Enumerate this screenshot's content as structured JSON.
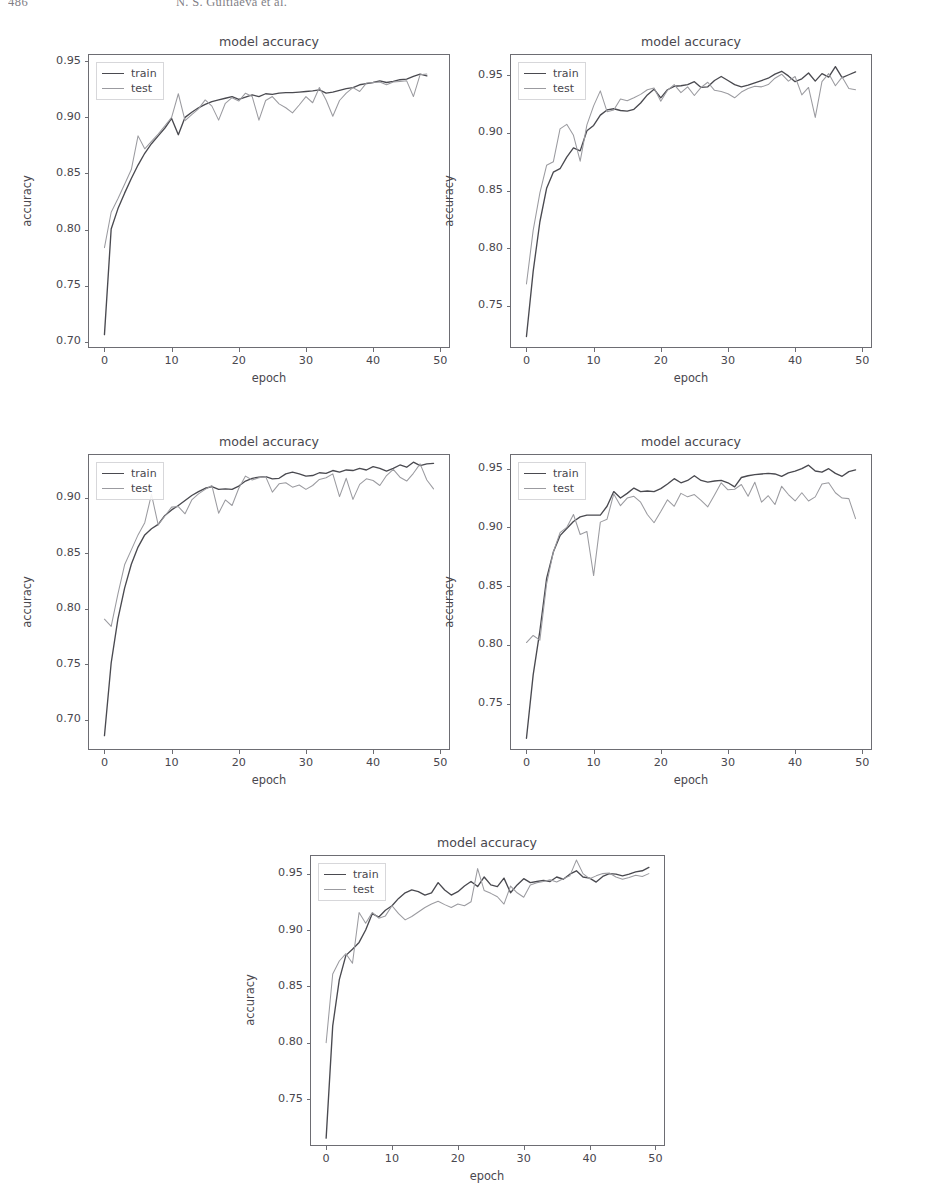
{
  "page": {
    "folio": "486",
    "running_title": "N. S. Gultiaeva et al."
  },
  "style": {
    "train_color": "#4a4a50",
    "test_color": "#9b9ba0",
    "axis_color": "#6d6d73",
    "text_color": "#49474e",
    "background": "#ffffff"
  },
  "legend": {
    "train_label": "train",
    "test_label": "test",
    "position": "upper left"
  },
  "chart_data": [
    {
      "id": "model-accuracy-1",
      "type": "line",
      "title": "model accuracy",
      "xlabel": "epoch",
      "ylabel": "accuracy",
      "xlim": [
        -2.45,
        51.45
      ],
      "ylim": [
        0.6946,
        0.9564
      ],
      "xticks": [
        0,
        10,
        20,
        30,
        40,
        50
      ],
      "xticklabels": [
        "0",
        "10",
        "20",
        "30",
        "40",
        "50"
      ],
      "yticks": [
        0.7,
        0.75,
        0.8,
        0.85,
        0.9,
        0.95
      ],
      "yticklabels": [
        "0.70",
        "0.75",
        "0.80",
        "0.85",
        "0.90",
        "0.95"
      ],
      "grid": false,
      "box": {
        "left": 88,
        "top": 54,
        "width": 362,
        "height": 294
      },
      "title_pos": {
        "x": 269,
        "y": 42
      },
      "xlabel_pos": {
        "x": 269,
        "y": 378
      },
      "ylabel_pos": {
        "x": 27,
        "y": 201
      },
      "legend_pos": {
        "x": 96,
        "y": 62
      },
      "x": [
        0,
        1,
        2,
        3,
        4,
        5,
        6,
        7,
        8,
        9,
        10,
        11,
        12,
        13,
        14,
        15,
        16,
        17,
        18,
        19,
        20,
        21,
        22,
        23,
        24,
        25,
        26,
        27,
        28,
        29,
        30,
        31,
        32,
        33,
        34,
        35,
        36,
        37,
        38,
        39,
        40,
        41,
        42,
        43,
        44,
        45,
        46,
        47,
        48
      ],
      "series": [
        {
          "name": "train",
          "values": [
            0.7065,
            0.8005,
            0.8185,
            0.8325,
            0.8455,
            0.8575,
            0.868,
            0.8765,
            0.8835,
            0.8905,
            0.899,
            0.8845,
            0.9,
            0.9045,
            0.9085,
            0.9115,
            0.914,
            0.9155,
            0.917,
            0.9185,
            0.916,
            0.918,
            0.92,
            0.9185,
            0.921,
            0.9205,
            0.9215,
            0.922,
            0.922,
            0.9225,
            0.923,
            0.9235,
            0.9245,
            0.9215,
            0.9225,
            0.924,
            0.9255,
            0.9265,
            0.929,
            0.93,
            0.931,
            0.9325,
            0.931,
            0.932,
            0.9335,
            0.934,
            0.9365,
            0.9385,
            0.937
          ]
        },
        {
          "name": "test",
          "values": [
            0.784,
            0.8155,
            0.8275,
            0.8405,
            0.8535,
            0.8835,
            0.872,
            0.8785,
            0.885,
            0.8925,
            0.9,
            0.921,
            0.897,
            0.9025,
            0.9075,
            0.9155,
            0.91,
            0.8975,
            0.9125,
            0.9175,
            0.9145,
            0.9215,
            0.9185,
            0.8975,
            0.915,
            0.9185,
            0.912,
            0.9085,
            0.904,
            0.911,
            0.9185,
            0.913,
            0.9265,
            0.9155,
            0.901,
            0.915,
            0.9215,
            0.9265,
            0.923,
            0.9305,
            0.931,
            0.9315,
            0.929,
            0.9315,
            0.932,
            0.9325,
            0.9185,
            0.938,
            0.9385
          ]
        }
      ]
    },
    {
      "id": "model-accuracy-2",
      "type": "line",
      "title": "model accuracy",
      "xlabel": "epoch",
      "ylabel": "accuracy",
      "xlim": [
        -2.45,
        51.45
      ],
      "ylim": [
        0.7135,
        0.9685
      ],
      "xticks": [
        0,
        10,
        20,
        30,
        40,
        50
      ],
      "xticklabels": [
        "0",
        "10",
        "20",
        "30",
        "40",
        "50"
      ],
      "yticks": [
        0.75,
        0.8,
        0.85,
        0.9,
        0.95
      ],
      "yticklabels": [
        "0.75",
        "0.80",
        "0.85",
        "0.90",
        "0.95"
      ],
      "grid": false,
      "box": {
        "left": 510,
        "top": 54,
        "width": 362,
        "height": 294
      },
      "title_pos": {
        "x": 691,
        "y": 42
      },
      "xlabel_pos": {
        "x": 691,
        "y": 378
      },
      "ylabel_pos": {
        "x": 449,
        "y": 201
      },
      "legend_pos": {
        "x": 518,
        "y": 62
      },
      "x": [
        0,
        1,
        2,
        3,
        4,
        5,
        6,
        7,
        8,
        9,
        10,
        11,
        12,
        13,
        14,
        15,
        16,
        17,
        18,
        19,
        20,
        21,
        22,
        23,
        24,
        25,
        26,
        27,
        28,
        29,
        30,
        31,
        32,
        33,
        34,
        35,
        36,
        37,
        38,
        39,
        40,
        41,
        42,
        43,
        44,
        45,
        46,
        47,
        48,
        49
      ],
      "series": [
        {
          "name": "train",
          "values": [
            0.7235,
            0.78,
            0.823,
            0.852,
            0.866,
            0.869,
            0.879,
            0.887,
            0.8845,
            0.902,
            0.9065,
            0.9155,
            0.92,
            0.921,
            0.9195,
            0.919,
            0.9205,
            0.926,
            0.933,
            0.938,
            0.9305,
            0.9375,
            0.9405,
            0.941,
            0.942,
            0.9445,
            0.9395,
            0.94,
            0.9455,
            0.949,
            0.9455,
            0.942,
            0.94,
            0.9415,
            0.9435,
            0.9455,
            0.9475,
            0.951,
            0.9535,
            0.9495,
            0.9445,
            0.947,
            0.952,
            0.945,
            0.9515,
            0.9485,
            0.9575,
            0.948,
            0.9505,
            0.953
          ]
        },
        {
          "name": "test",
          "values": [
            0.769,
            0.8155,
            0.848,
            0.872,
            0.875,
            0.9035,
            0.9075,
            0.898,
            0.8755,
            0.907,
            0.9235,
            0.9365,
            0.9185,
            0.92,
            0.9295,
            0.928,
            0.9305,
            0.9335,
            0.9375,
            0.939,
            0.9275,
            0.937,
            0.942,
            0.935,
            0.94,
            0.9325,
            0.9395,
            0.944,
            0.937,
            0.936,
            0.934,
            0.9305,
            0.9355,
            0.9385,
            0.9405,
            0.94,
            0.942,
            0.9475,
            0.951,
            0.945,
            0.949,
            0.933,
            0.9395,
            0.9135,
            0.9445,
            0.9515,
            0.941,
            0.9485,
            0.9385,
            0.9375
          ]
        }
      ]
    },
    {
      "id": "model-accuracy-3",
      "type": "line",
      "title": "model accuracy",
      "xlabel": "epoch",
      "ylabel": "accuracy",
      "xlim": [
        -2.45,
        51.45
      ],
      "ylim": [
        0.6726,
        0.9394
      ],
      "xticks": [
        0,
        10,
        20,
        30,
        40,
        50
      ],
      "xticklabels": [
        "0",
        "10",
        "20",
        "30",
        "40",
        "50"
      ],
      "yticks": [
        0.7,
        0.75,
        0.8,
        0.85,
        0.9
      ],
      "yticklabels": [
        "0.70",
        "0.75",
        "0.80",
        "0.85",
        "0.90"
      ],
      "grid": false,
      "box": {
        "left": 88,
        "top": 454,
        "width": 362,
        "height": 296
      },
      "title_pos": {
        "x": 269,
        "y": 442
      },
      "xlabel_pos": {
        "x": 269,
        "y": 780
      },
      "ylabel_pos": {
        "x": 27,
        "y": 602
      },
      "legend_pos": {
        "x": 96,
        "y": 462
      },
      "x": [
        0,
        1,
        2,
        3,
        4,
        5,
        6,
        7,
        8,
        9,
        10,
        11,
        12,
        13,
        14,
        15,
        16,
        17,
        18,
        19,
        20,
        21,
        22,
        23,
        24,
        25,
        26,
        27,
        28,
        29,
        30,
        31,
        32,
        33,
        34,
        35,
        36,
        37,
        38,
        39,
        40,
        41,
        42,
        43,
        44,
        45,
        46,
        47,
        48,
        49
      ],
      "series": [
        {
          "name": "train",
          "values": [
            0.6855,
            0.751,
            0.7905,
            0.8185,
            0.84,
            0.8555,
            0.8665,
            0.872,
            0.876,
            0.884,
            0.889,
            0.893,
            0.8975,
            0.902,
            0.9055,
            0.9085,
            0.91,
            0.9075,
            0.908,
            0.9075,
            0.9105,
            0.915,
            0.9175,
            0.9185,
            0.919,
            0.917,
            0.9175,
            0.9215,
            0.923,
            0.9215,
            0.9195,
            0.92,
            0.9225,
            0.922,
            0.9245,
            0.923,
            0.925,
            0.9245,
            0.9265,
            0.925,
            0.928,
            0.9265,
            0.924,
            0.9265,
            0.9295,
            0.9275,
            0.932,
            0.929,
            0.9305,
            0.931
          ]
        },
        {
          "name": "test",
          "values": [
            0.7905,
            0.784,
            0.813,
            0.8395,
            0.853,
            0.8665,
            0.8775,
            0.903,
            0.8755,
            0.8835,
            0.8915,
            0.892,
            0.8855,
            0.898,
            0.9035,
            0.9075,
            0.911,
            0.886,
            0.898,
            0.893,
            0.9085,
            0.9195,
            0.916,
            0.918,
            0.919,
            0.905,
            0.9125,
            0.9135,
            0.9095,
            0.9115,
            0.9075,
            0.911,
            0.9165,
            0.918,
            0.9215,
            0.901,
            0.9175,
            0.8985,
            0.912,
            0.917,
            0.9155,
            0.911,
            0.92,
            0.9255,
            0.9185,
            0.915,
            0.922,
            0.9305,
            0.916,
            0.908
          ]
        }
      ]
    },
    {
      "id": "model-accuracy-4",
      "type": "line",
      "title": "model accuracy",
      "xlabel": "epoch",
      "ylabel": "accuracy",
      "xlim": [
        -2.45,
        51.45
      ],
      "ylim": [
        0.7105,
        0.9625
      ],
      "xticks": [
        0,
        10,
        20,
        30,
        40,
        50
      ],
      "xticklabels": [
        "0",
        "10",
        "20",
        "30",
        "40",
        "50"
      ],
      "yticks": [
        0.75,
        0.8,
        0.85,
        0.9,
        0.95
      ],
      "yticklabels": [
        "0.75",
        "0.80",
        "0.85",
        "0.90",
        "0.95"
      ],
      "grid": false,
      "box": {
        "left": 510,
        "top": 454,
        "width": 362,
        "height": 296
      },
      "title_pos": {
        "x": 691,
        "y": 442
      },
      "xlabel_pos": {
        "x": 691,
        "y": 780
      },
      "ylabel_pos": {
        "x": 449,
        "y": 602
      },
      "legend_pos": {
        "x": 518,
        "y": 462
      },
      "x": [
        0,
        1,
        2,
        3,
        4,
        5,
        6,
        7,
        8,
        9,
        10,
        11,
        12,
        13,
        14,
        15,
        16,
        17,
        18,
        19,
        20,
        21,
        22,
        23,
        24,
        25,
        26,
        27,
        28,
        29,
        30,
        31,
        32,
        33,
        34,
        35,
        36,
        37,
        38,
        39,
        40,
        41,
        42,
        43,
        44,
        45,
        46,
        47,
        48,
        49
      ],
      "series": [
        {
          "name": "train",
          "values": [
            0.7205,
            0.7745,
            0.812,
            0.8565,
            0.879,
            0.893,
            0.899,
            0.905,
            0.909,
            0.9105,
            0.9105,
            0.9105,
            0.918,
            0.9305,
            0.925,
            0.929,
            0.9335,
            0.9305,
            0.931,
            0.9305,
            0.933,
            0.937,
            0.9415,
            0.938,
            0.94,
            0.944,
            0.94,
            0.9385,
            0.9395,
            0.94,
            0.938,
            0.9345,
            0.9425,
            0.944,
            0.945,
            0.9455,
            0.946,
            0.9455,
            0.9435,
            0.9465,
            0.948,
            0.95,
            0.953,
            0.948,
            0.947,
            0.95,
            0.946,
            0.9435,
            0.9475,
            0.949
          ]
        },
        {
          "name": "test",
          "values": [
            0.802,
            0.808,
            0.804,
            0.852,
            0.879,
            0.8955,
            0.9,
            0.911,
            0.894,
            0.8965,
            0.859,
            0.9045,
            0.907,
            0.9285,
            0.9185,
            0.925,
            0.9265,
            0.9215,
            0.911,
            0.904,
            0.9135,
            0.9235,
            0.918,
            0.929,
            0.926,
            0.928,
            0.923,
            0.9175,
            0.9275,
            0.938,
            0.932,
            0.9325,
            0.9365,
            0.9265,
            0.9385,
            0.9215,
            0.927,
            0.9195,
            0.935,
            0.928,
            0.9225,
            0.9295,
            0.9225,
            0.926,
            0.937,
            0.938,
            0.9295,
            0.925,
            0.9245,
            0.9075
          ]
        }
      ]
    },
    {
      "id": "model-accuracy-5",
      "type": "line",
      "title": "model accuracy",
      "xlabel": "epoch",
      "ylabel": "accuracy",
      "xlim": [
        -2.45,
        51.45
      ],
      "ylim": [
        0.7085,
        0.9665
      ],
      "xticks": [
        0,
        10,
        20,
        30,
        40,
        50
      ],
      "xticklabels": [
        "0",
        "10",
        "20",
        "30",
        "40",
        "50"
      ],
      "yticks": [
        0.75,
        0.8,
        0.85,
        0.9,
        0.95
      ],
      "yticklabels": [
        "0.75",
        "0.80",
        "0.85",
        "0.90",
        "0.95"
      ],
      "grid": false,
      "box": {
        "left": 310,
        "top": 855,
        "width": 355,
        "height": 291
      },
      "title_pos": {
        "x": 487,
        "y": 843
      },
      "xlabel_pos": {
        "x": 487,
        "y": 1176
      },
      "ylabel_pos": {
        "x": 250,
        "y": 1000
      },
      "legend_pos": {
        "x": 318,
        "y": 863
      },
      "x": [
        0,
        1,
        2,
        3,
        4,
        5,
        6,
        7,
        8,
        9,
        10,
        11,
        12,
        13,
        14,
        15,
        16,
        17,
        18,
        19,
        20,
        21,
        22,
        23,
        24,
        25,
        26,
        27,
        28,
        29,
        30,
        31,
        32,
        33,
        34,
        35,
        36,
        37,
        38,
        39,
        40,
        41,
        42,
        43,
        44,
        45,
        46,
        47,
        48,
        49
      ],
      "series": [
        {
          "name": "train",
          "values": [
            0.7155,
            0.815,
            0.856,
            0.8775,
            0.883,
            0.889,
            0.9,
            0.9145,
            0.9115,
            0.9175,
            0.9215,
            0.928,
            0.933,
            0.9355,
            0.934,
            0.931,
            0.933,
            0.942,
            0.9355,
            0.931,
            0.934,
            0.939,
            0.943,
            0.9385,
            0.947,
            0.94,
            0.9385,
            0.946,
            0.933,
            0.94,
            0.9455,
            0.942,
            0.943,
            0.944,
            0.943,
            0.947,
            0.945,
            0.9495,
            0.9525,
            0.947,
            0.946,
            0.9425,
            0.9475,
            0.95,
            0.9495,
            0.948,
            0.9495,
            0.9515,
            0.9525,
            0.9555
          ]
        },
        {
          "name": "test",
          "values": [
            0.8,
            0.861,
            0.8725,
            0.879,
            0.8705,
            0.9155,
            0.906,
            0.9155,
            0.9105,
            0.9125,
            0.9215,
            0.9145,
            0.909,
            0.912,
            0.916,
            0.92,
            0.923,
            0.9255,
            0.9225,
            0.92,
            0.923,
            0.9215,
            0.925,
            0.9545,
            0.935,
            0.9325,
            0.9295,
            0.923,
            0.939,
            0.933,
            0.929,
            0.94,
            0.942,
            0.943,
            0.9445,
            0.9425,
            0.9455,
            0.948,
            0.962,
            0.95,
            0.9455,
            0.948,
            0.95,
            0.9505,
            0.947,
            0.945,
            0.9465,
            0.9485,
            0.9475,
            0.95
          ]
        }
      ]
    }
  ]
}
